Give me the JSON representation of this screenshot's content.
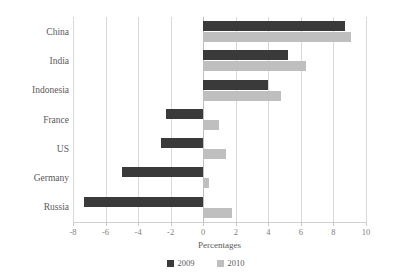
{
  "chart_data": {
    "type": "bar",
    "orientation": "horizontal",
    "title": "",
    "xlabel": "Percentages",
    "ylabel": "",
    "xlim": [
      -8,
      10
    ],
    "xticks": [
      -8,
      -6,
      -4,
      -2,
      0,
      2,
      4,
      6,
      8,
      10
    ],
    "xtick_labels": [
      "-8",
      "-6",
      "-4",
      "-2",
      "0",
      "2",
      "4",
      "6",
      "8",
      "10"
    ],
    "grid": true,
    "grid_axis": "x",
    "legend_position": "bottom",
    "categories": [
      "China",
      "India",
      "Indonesia",
      "France",
      "US",
      "Germany",
      "Russia"
    ],
    "series": [
      {
        "name": "2009",
        "color": "#3a3a3a",
        "values": [
          8.7,
          5.2,
          4.0,
          -2.3,
          -2.6,
          -5.0,
          -7.3
        ]
      },
      {
        "name": "2010",
        "color": "#bfbfbf",
        "values": [
          9.1,
          6.3,
          4.8,
          1.0,
          1.4,
          0.35,
          1.75
        ]
      }
    ]
  },
  "axis": {
    "x_title": "Percentages"
  },
  "legend": {
    "items": [
      {
        "label": "2009",
        "color": "#3a3a3a"
      },
      {
        "label": "2010",
        "color": "#bfbfbf"
      }
    ]
  }
}
